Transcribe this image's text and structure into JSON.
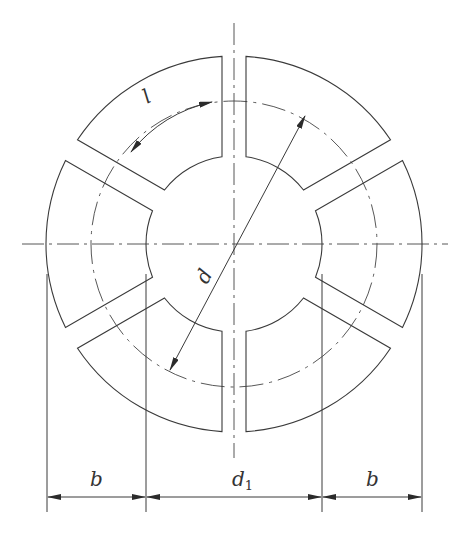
{
  "diagram": {
    "type": "segmented-annulus-drawing",
    "segment_count": 6,
    "labels": {
      "arc_length": "l",
      "pitch_diameter": "d",
      "inner_diameter": "d",
      "inner_diameter_subscript": "1",
      "width_left": "b",
      "width_right": "b"
    },
    "colors": {
      "line": "#3a3a3a",
      "background": "#ffffff"
    }
  }
}
